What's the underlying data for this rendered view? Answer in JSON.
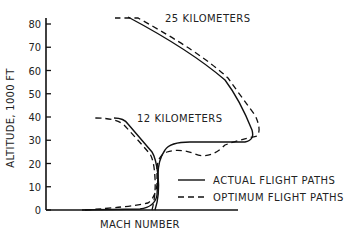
{
  "chart_data": {
    "type": "line",
    "title": "",
    "xlabel": "MACH NUMBER",
    "ylabel": "ALTITUDE, 1000 FT",
    "ylim": [
      0,
      80
    ],
    "yticks": [
      0,
      10,
      20,
      30,
      40,
      50,
      60,
      70,
      80
    ],
    "ytick_labels": [
      "0",
      "10",
      "20",
      "30",
      "40",
      "50",
      "60",
      "70",
      "80"
    ],
    "xticks": [],
    "grid": false,
    "legend_position": "lower right",
    "legend": [
      {
        "label": "ACTUAL FLIGHT PATHS",
        "style": "solid"
      },
      {
        "label": "OPTIMUM FLIGHT PATHS",
        "style": "dashed"
      }
    ],
    "annotations": [
      {
        "text": "25 KILOMETERS",
        "altitude": 82
      },
      {
        "text": "12 KILOMETERS",
        "altitude": 39
      }
    ],
    "series": [
      {
        "name": "Actual flight path to 25 km",
        "style": "solid",
        "points": [
          [
            0.05,
            0
          ],
          [
            0.35,
            0
          ],
          [
            0.45,
            2
          ],
          [
            0.47,
            10
          ],
          [
            0.47,
            18
          ],
          [
            0.5,
            26
          ],
          [
            0.55,
            29
          ],
          [
            0.8,
            29
          ],
          [
            0.95,
            29
          ],
          [
            0.97,
            31
          ],
          [
            0.95,
            37
          ],
          [
            0.8,
            62
          ],
          [
            0.55,
            75
          ],
          [
            0.4,
            82
          ]
        ]
      },
      {
        "name": "Optimum flight path to 25 km",
        "style": "dashed",
        "points": [
          [
            0.05,
            0
          ],
          [
            0.3,
            1
          ],
          [
            0.42,
            4
          ],
          [
            0.46,
            12
          ],
          [
            0.47,
            18
          ],
          [
            0.52,
            24
          ],
          [
            0.62,
            23
          ],
          [
            0.75,
            26
          ],
          [
            0.85,
            28
          ],
          [
            0.98,
            32
          ],
          [
            0.97,
            37
          ],
          [
            0.83,
            62
          ],
          [
            0.58,
            76
          ],
          [
            0.4,
            82
          ],
          [
            0.3,
            82
          ]
        ]
      },
      {
        "name": "Actual flight path to 12 km",
        "style": "solid",
        "points": [
          [
            0.47,
            0
          ],
          [
            0.47,
            10
          ],
          [
            0.46,
            20
          ],
          [
            0.43,
            26
          ],
          [
            0.36,
            33
          ],
          [
            0.3,
            38
          ],
          [
            0.26,
            39
          ]
        ]
      },
      {
        "name": "Optimum flight path to 12 km",
        "style": "dashed",
        "points": [
          [
            0.47,
            0
          ],
          [
            0.46,
            10
          ],
          [
            0.44,
            20
          ],
          [
            0.4,
            26
          ],
          [
            0.33,
            33
          ],
          [
            0.27,
            37
          ],
          [
            0.2,
            39
          ],
          [
            0.14,
            39
          ]
        ]
      }
    ]
  }
}
